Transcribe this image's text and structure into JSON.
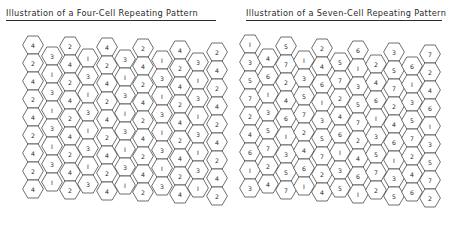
{
  "left_panel": {
    "title": "Illustration of a Four-Cell Repeating Pattern",
    "hex_radius": 10.4,
    "row_pitch": 18,
    "columns": [
      {
        "x": 33,
        "top_y": 45,
        "values": [
          4,
          2,
          4,
          2,
          4,
          2,
          4,
          2,
          4
        ]
      },
      {
        "x": 52,
        "top_y": 56,
        "values": [
          3,
          1,
          3,
          1,
          3,
          1,
          3,
          1
        ]
      },
      {
        "x": 70,
        "top_y": 46,
        "values": [
          2,
          4,
          2,
          4,
          2,
          4,
          2,
          4,
          2
        ]
      },
      {
        "x": 88,
        "top_y": 58,
        "values": [
          1,
          3,
          1,
          3,
          1,
          3,
          1,
          3
        ]
      },
      {
        "x": 107,
        "top_y": 47,
        "values": [
          4,
          2,
          4,
          2,
          4,
          2,
          4,
          2,
          4
        ]
      },
      {
        "x": 125,
        "top_y": 59,
        "values": [
          3,
          1,
          3,
          1,
          3,
          1,
          3,
          1
        ]
      },
      {
        "x": 143,
        "top_y": 48,
        "values": [
          2,
          4,
          2,
          4,
          2,
          4,
          2,
          4,
          2
        ]
      },
      {
        "x": 162,
        "top_y": 60,
        "values": [
          1,
          3,
          1,
          3,
          1,
          3,
          1,
          3
        ]
      },
      {
        "x": 180,
        "top_y": 50,
        "values": [
          4,
          2,
          4,
          2,
          4,
          2,
          4,
          2,
          4
        ]
      },
      {
        "x": 198,
        "top_y": 62,
        "values": [
          3,
          1,
          3,
          1,
          3,
          1,
          3,
          1
        ]
      },
      {
        "x": 217,
        "top_y": 52,
        "values": [
          2,
          4,
          2,
          4,
          2,
          4,
          2,
          4,
          2
        ]
      }
    ]
  },
  "right_panel": {
    "title": "Illustration of a Seven-Cell Repeating Pattern",
    "hex_radius": 10.4,
    "row_pitch": 18,
    "columns": [
      {
        "x": 250,
        "top_y": 44,
        "values": [
          1,
          3,
          5,
          7,
          2,
          4,
          6,
          1,
          3
        ]
      },
      {
        "x": 268,
        "top_y": 58,
        "values": [
          4,
          6,
          1,
          3,
          5,
          7,
          2,
          4
        ]
      },
      {
        "x": 286,
        "top_y": 46,
        "values": [
          5,
          7,
          2,
          4,
          6,
          1,
          3,
          5,
          7
        ]
      },
      {
        "x": 304,
        "top_y": 60,
        "values": [
          1,
          3,
          5,
          7,
          2,
          4,
          6,
          1
        ]
      },
      {
        "x": 322,
        "top_y": 48,
        "values": [
          2,
          4,
          6,
          1,
          3,
          5,
          7,
          2,
          4
        ]
      },
      {
        "x": 340,
        "top_y": 62,
        "values": [
          5,
          7,
          2,
          4,
          6,
          1,
          3,
          5
        ]
      },
      {
        "x": 358,
        "top_y": 50,
        "values": [
          6,
          1,
          3,
          5,
          7,
          2,
          4,
          6,
          1
        ]
      },
      {
        "x": 376,
        "top_y": 64,
        "values": [
          2,
          4,
          6,
          1,
          3,
          5,
          7,
          2
        ]
      },
      {
        "x": 394,
        "top_y": 52,
        "values": [
          3,
          5,
          7,
          2,
          4,
          6,
          1,
          3,
          5
        ]
      },
      {
        "x": 412,
        "top_y": 66,
        "values": [
          6,
          1,
          3,
          5,
          7,
          2,
          4,
          6
        ]
      },
      {
        "x": 430,
        "top_y": 54,
        "values": [
          7,
          2,
          4,
          6,
          1,
          3,
          5,
          7,
          2
        ]
      }
    ]
  }
}
